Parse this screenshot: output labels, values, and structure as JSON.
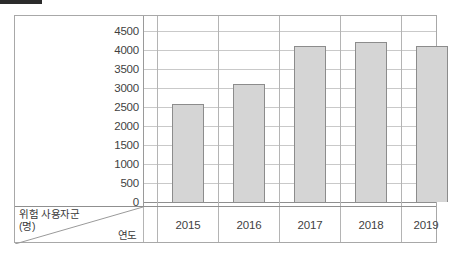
{
  "chart_data": {
    "type": "bar",
    "title": "",
    "categories": [
      "2015",
      "2016",
      "2017",
      "2018",
      "2019"
    ],
    "values": [
      2570,
      3110,
      4100,
      4200,
      4100
    ],
    "series": [
      {
        "name": "위험 사용자군",
        "values": [
          2570,
          3110,
          4100,
          4200,
          4100
        ]
      }
    ],
    "xlabel": "연도",
    "ylabel": "위험 사용자군",
    "ylabel_unit": "(명)",
    "ylim": [
      0,
      4500
    ],
    "ytick_step": 500,
    "yticks": [
      4500,
      4000,
      3500,
      3000,
      2500,
      2000,
      1500,
      1000,
      500,
      0
    ],
    "ytick_labels": [
      "4500",
      "4000",
      "3500",
      "3000",
      "2500",
      "2000",
      "1500",
      "1000",
      "500",
      "0"
    ],
    "grid": true,
    "legend": false,
    "legend_position": "none",
    "bar_fill_color": "#d5d5d5",
    "bar_border_color": "#8c8c8c",
    "gridline_color": "#c9c9c9",
    "axis_color": "#8f8f8f",
    "frame_color": "#a8a8a8",
    "marker_color": "#2b2b2b"
  },
  "corner": {
    "y_axis_caption_line1": "위험 사용자군",
    "y_axis_caption_line2": "(명)",
    "x_axis_caption": "연도"
  }
}
